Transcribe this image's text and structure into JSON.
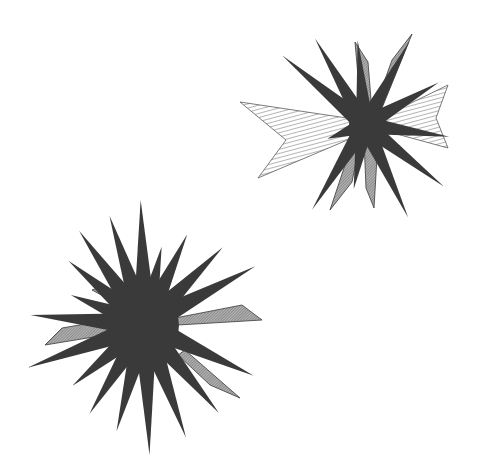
{
  "canvas": {
    "width": 477,
    "height": 475,
    "background": "#ffffff"
  },
  "colors": {
    "ink": "#3a3a3a",
    "hatch": "#5a5a5a",
    "shade": "#8a8a8a"
  },
  "starbursts": [
    {
      "name": "upper-right-starburst",
      "center": [
        365,
        125
      ],
      "core_radius": 16,
      "spikes": [
        {
          "angle": -120,
          "length": 100,
          "width": 9
        },
        {
          "angle": -140,
          "length": 108,
          "width": 9
        },
        {
          "angle": -95,
          "length": 85,
          "width": 9
        },
        {
          "angle": -62,
          "length": 95,
          "width": 9
        },
        {
          "angle": -30,
          "length": 85,
          "width": 9
        },
        {
          "angle": 8,
          "length": 85,
          "width": 9
        },
        {
          "angle": 38,
          "length": 100,
          "width": 9
        },
        {
          "angle": 65,
          "length": 102,
          "width": 9
        },
        {
          "angle": 100,
          "length": 65,
          "width": 9
        },
        {
          "angle": 122,
          "length": 100,
          "width": 9
        },
        {
          "angle": 160,
          "length": 40,
          "width": 9
        }
      ],
      "hatched_shapes": [
        {
          "type": "chevron",
          "points": [
            [
              240,
              102
            ],
            [
              360,
              120
            ],
            [
              352,
              138
            ],
            [
              258,
              178
            ],
            [
              286,
              140
            ]
          ]
        },
        {
          "type": "chevron",
          "points": [
            [
              448,
              85
            ],
            [
              372,
              122
            ],
            [
              382,
              130
            ],
            [
              448,
              148
            ],
            [
              436,
              118
            ]
          ]
        }
      ],
      "shaded_shapes": [
        {
          "points": [
            [
              355,
              42
            ],
            [
              368,
              62
            ],
            [
              372,
              112
            ],
            [
              361,
              110
            ]
          ]
        },
        {
          "points": [
            [
              412,
              34
            ],
            [
              392,
              60
            ],
            [
              374,
              110
            ],
            [
              382,
              108
            ]
          ]
        },
        {
          "points": [
            [
              364,
              140
            ],
            [
              378,
              140
            ],
            [
              374,
              208
            ],
            [
              366,
              188
            ]
          ]
        },
        {
          "points": [
            [
              330,
              210
            ],
            [
              352,
              182
            ],
            [
              360,
              142
            ],
            [
              350,
              150
            ]
          ]
        }
      ]
    },
    {
      "name": "lower-left-starburst",
      "center": [
        145,
        325
      ],
      "core_radius": 34,
      "spikes": [
        {
          "angle": -92,
          "length": 125,
          "width": 12
        },
        {
          "angle": -108,
          "length": 115,
          "width": 12
        },
        {
          "angle": -125,
          "length": 115,
          "width": 12
        },
        {
          "angle": -140,
          "length": 100,
          "width": 12
        },
        {
          "angle": -158,
          "length": 80,
          "width": 12
        },
        {
          "angle": -175,
          "length": 115,
          "width": 12
        },
        {
          "angle": 160,
          "length": 125,
          "width": 12
        },
        {
          "angle": 140,
          "length": 95,
          "width": 12
        },
        {
          "angle": 122,
          "length": 105,
          "width": 12
        },
        {
          "angle": 105,
          "length": 110,
          "width": 12
        },
        {
          "angle": 88,
          "length": 130,
          "width": 12
        },
        {
          "angle": 70,
          "length": 120,
          "width": 12
        },
        {
          "angle": 50,
          "length": 115,
          "width": 12
        },
        {
          "angle": 25,
          "length": 120,
          "width": 12
        },
        {
          "angle": -28,
          "length": 125,
          "width": 12
        },
        {
          "angle": -45,
          "length": 110,
          "width": 12
        },
        {
          "angle": -65,
          "length": 100,
          "width": 12
        },
        {
          "angle": -78,
          "length": 80,
          "width": 12
        }
      ],
      "hatched_shapes": [],
      "shaded_shapes": [
        {
          "points": [
            [
              45,
              345
            ],
            [
              62,
              328
            ],
            [
              120,
              318
            ],
            [
              118,
              333
            ]
          ]
        },
        {
          "points": [
            [
              262,
              320
            ],
            [
              242,
              305
            ],
            [
              175,
              318
            ],
            [
              178,
              325
            ]
          ]
        },
        {
          "points": [
            [
              92,
              290
            ],
            [
              100,
              287
            ],
            [
              125,
              300
            ],
            [
              118,
              304
            ]
          ]
        },
        {
          "points": [
            [
              240,
              398
            ],
            [
              210,
              385
            ],
            [
              178,
              355
            ],
            [
              185,
              350
            ]
          ]
        }
      ]
    }
  ]
}
